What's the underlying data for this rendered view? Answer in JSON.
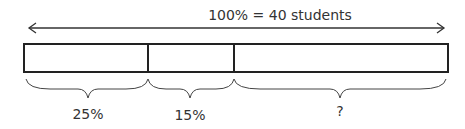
{
  "diagram": {
    "total_label": "100% = 40 students",
    "segments": [
      {
        "label": "25%",
        "percent": 25
      },
      {
        "label": "15%",
        "percent": 15
      },
      {
        "label": "?",
        "percent": 60
      }
    ],
    "stroke_color": "#222222"
  }
}
